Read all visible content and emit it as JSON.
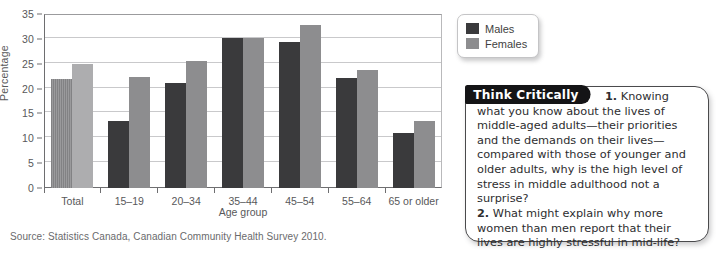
{
  "chart_data": {
    "type": "bar",
    "title": "",
    "xlabel": "Age group",
    "ylabel": "Percentage",
    "ylim": [
      0,
      35
    ],
    "yticks": [
      0,
      5,
      10,
      15,
      20,
      25,
      30,
      35
    ],
    "ytick_labels": [
      "0",
      "5",
      "10",
      "15",
      "20",
      "25",
      "30",
      "35"
    ],
    "grid": true,
    "legend_position": "top-right-outside",
    "categories": [
      "Total",
      "15–19",
      "20–34",
      "35–44",
      "45–54",
      "55–64",
      "65 or older"
    ],
    "series": [
      {
        "name": "Males",
        "color": "#3a3a3c",
        "values": [
          22.0,
          13.5,
          21.2,
          30.1,
          29.3,
          22.2,
          11.0
        ]
      },
      {
        "name": "Females",
        "color": "#8d8d8f",
        "values": [
          25.0,
          22.3,
          25.6,
          30.2,
          32.7,
          23.8,
          13.5
        ]
      }
    ],
    "source": "Source: Statistics Canada, Canadian Community Health Survey 2010."
  },
  "legend": {
    "items": [
      {
        "label": "Males",
        "swatch": "male-swatch"
      },
      {
        "label": "Females",
        "swatch": "female-swatch"
      }
    ]
  },
  "think_critically": {
    "tag": "Think Critically",
    "question_1_number": "1.",
    "question_1": " Knowing what you know about the lives of middle-aged adults—their priorities and the demands on their lives—compared with those of younger and older adults, why is the high level of stress in middle adulthood not a surprise?",
    "question_2_number": "2.",
    "question_2": " What might explain why more women than men report that their lives are highly stressful in mid-life?"
  }
}
